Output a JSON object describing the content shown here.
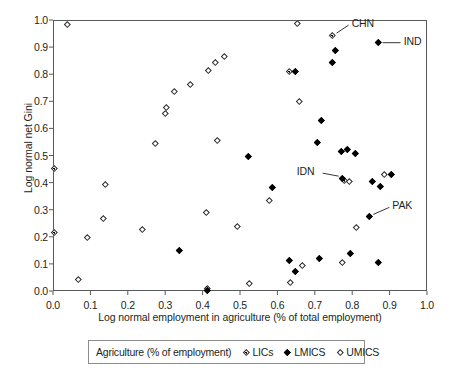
{
  "chart_data": {
    "type": "scatter",
    "title": "",
    "xlabel": "Log normal employment in agriculture (% of total employment)",
    "ylabel": "Log normal net Gini",
    "xlim": [
      0.0,
      1.0
    ],
    "ylim": [
      0.0,
      1.0
    ],
    "xticks": [
      "0.0",
      "0.1",
      "0.2",
      "0.3",
      "0.4",
      "0.5",
      "0.6",
      "0.7",
      "0.8",
      "0.9",
      "1.0"
    ],
    "yticks": [
      "0.0",
      "0.1",
      "0.2",
      "0.3",
      "0.4",
      "0.5",
      "0.6",
      "0.7",
      "0.8",
      "0.9",
      "1.0"
    ],
    "grid": false,
    "legend_position": "below-plot",
    "legend_title": "Agriculture (% of employment)",
    "series": [
      {
        "name": "LICs",
        "marker": "dotted-diamond",
        "color": "#000000",
        "points": [
          {
            "x": 0.0,
            "y": 0.455
          },
          {
            "x": 0.0,
            "y": 0.222
          },
          {
            "x": 0.41,
            "y": 0.012
          },
          {
            "x": 0.63,
            "y": 0.815
          },
          {
            "x": 0.745,
            "y": 0.948,
            "label": "CHN"
          },
          {
            "x": 0.775,
            "y": 0.412
          }
        ]
      },
      {
        "name": "LMICS",
        "marker": "filled-diamond",
        "color": "#000000",
        "points": [
          {
            "x": 0.335,
            "y": 0.154
          },
          {
            "x": 0.41,
            "y": 0.008
          },
          {
            "x": 0.52,
            "y": 0.5
          },
          {
            "x": 0.585,
            "y": 0.388
          },
          {
            "x": 0.63,
            "y": 0.118
          },
          {
            "x": 0.645,
            "y": 0.078
          },
          {
            "x": 0.645,
            "y": 0.815
          },
          {
            "x": 0.705,
            "y": 0.553
          },
          {
            "x": 0.71,
            "y": 0.123
          },
          {
            "x": 0.715,
            "y": 0.632
          },
          {
            "x": 0.745,
            "y": 0.849
          },
          {
            "x": 0.752,
            "y": 0.89
          },
          {
            "x": 0.768,
            "y": 0.518
          },
          {
            "x": 0.772,
            "y": 0.42,
            "label": "IDN"
          },
          {
            "x": 0.785,
            "y": 0.525
          },
          {
            "x": 0.792,
            "y": 0.144
          },
          {
            "x": 0.805,
            "y": 0.51
          },
          {
            "x": 0.843,
            "y": 0.279,
            "label": "PAK"
          },
          {
            "x": 0.852,
            "y": 0.41
          },
          {
            "x": 0.866,
            "y": 0.108
          },
          {
            "x": 0.868,
            "y": 0.92,
            "label": "IND"
          },
          {
            "x": 0.872,
            "y": 0.39
          },
          {
            "x": 0.902,
            "y": 0.436
          }
        ]
      },
      {
        "name": "UMICS",
        "marker": "open-diamond",
        "color": "#2a2a2a",
        "points": [
          {
            "x": 0.035,
            "y": 0.987
          },
          {
            "x": 0.065,
            "y": 0.048
          },
          {
            "x": 0.088,
            "y": 0.203
          },
          {
            "x": 0.133,
            "y": 0.272
          },
          {
            "x": 0.138,
            "y": 0.396
          },
          {
            "x": 0.235,
            "y": 0.23
          },
          {
            "x": 0.272,
            "y": 0.548
          },
          {
            "x": 0.298,
            "y": 0.658
          },
          {
            "x": 0.3,
            "y": 0.681
          },
          {
            "x": 0.322,
            "y": 0.74
          },
          {
            "x": 0.365,
            "y": 0.765
          },
          {
            "x": 0.408,
            "y": 0.293
          },
          {
            "x": 0.412,
            "y": 0.818
          },
          {
            "x": 0.432,
            "y": 0.846
          },
          {
            "x": 0.438,
            "y": 0.56
          },
          {
            "x": 0.455,
            "y": 0.87
          },
          {
            "x": 0.49,
            "y": 0.241
          },
          {
            "x": 0.522,
            "y": 0.032
          },
          {
            "x": 0.575,
            "y": 0.34
          },
          {
            "x": 0.632,
            "y": 0.035
          },
          {
            "x": 0.65,
            "y": 0.99
          },
          {
            "x": 0.655,
            "y": 0.703
          },
          {
            "x": 0.663,
            "y": 0.1
          },
          {
            "x": 0.772,
            "y": 0.108
          },
          {
            "x": 0.79,
            "y": 0.41
          },
          {
            "x": 0.808,
            "y": 0.238
          },
          {
            "x": 0.884,
            "y": 0.436
          }
        ]
      }
    ],
    "annotations": [
      {
        "text": "CHN",
        "x": 0.745,
        "y": 0.948
      },
      {
        "text": "IND",
        "x": 0.868,
        "y": 0.92
      },
      {
        "text": "IDN",
        "x": 0.772,
        "y": 0.42
      },
      {
        "text": "PAK",
        "x": 0.843,
        "y": 0.279
      }
    ]
  },
  "legend": {
    "title": "Agriculture (% of employment)",
    "entries": [
      {
        "label": "LICs",
        "marker": "dotted-diamond"
      },
      {
        "label": "LMICS",
        "marker": "filled-diamond"
      },
      {
        "label": "UMICS",
        "marker": "open-diamond"
      }
    ]
  },
  "annotation_labels": {
    "chn": "CHN",
    "ind": "IND",
    "idn": "IDN",
    "pak": "PAK"
  }
}
